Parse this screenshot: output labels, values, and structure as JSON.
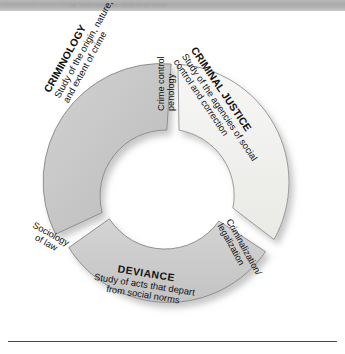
{
  "header": {
    "blurred_text_left": "........ .... ....",
    "blurred_text_right": "... ...... ...... .... ...... .. ... ......"
  },
  "diagram": {
    "type": "donut-segments",
    "title": "",
    "center": {
      "x": 172,
      "y": 182
    },
    "inner_radius": 52,
    "outer_radius": 118,
    "colors": {
      "criminology_fill": "#c6c6c6",
      "criminal_justice_fill": "#f1f1ef",
      "deviance_fill": "#cacaca",
      "stroke": "#8a8a8a",
      "shadow": "#bfbfbf",
      "text": "#111111",
      "rule": "#4a4a4a"
    },
    "segments": [
      {
        "id": "criminology",
        "title": "CRIMINOLOGY",
        "description_line1": "Study of the origin, nature,",
        "description_line2": "and extent of crime",
        "start_angle": 188,
        "end_angle": 352
      },
      {
        "id": "criminal-justice",
        "title": "CRIMINAL JUSTICE",
        "description_line1": "Study of the agencies of social",
        "description_line2": "control and correction",
        "start_angle": 8,
        "end_angle": 128
      },
      {
        "id": "deviance",
        "title": "DEVIANCE",
        "description_line1": "Study of acts that depart",
        "description_line2": "from social norms",
        "start_angle": 146,
        "end_angle": 29
      }
    ],
    "gap_labels": [
      {
        "id": "crime-control-penology",
        "line1": "Crime control",
        "line2": "penology",
        "position": "top"
      },
      {
        "id": "criminalization-legalization",
        "line1": "Criminalization/",
        "line2": "legalization",
        "position": "bottom-right"
      },
      {
        "id": "sociology-of-law",
        "line1": "Sociology",
        "line2": "of law",
        "position": "bottom-left"
      }
    ]
  }
}
